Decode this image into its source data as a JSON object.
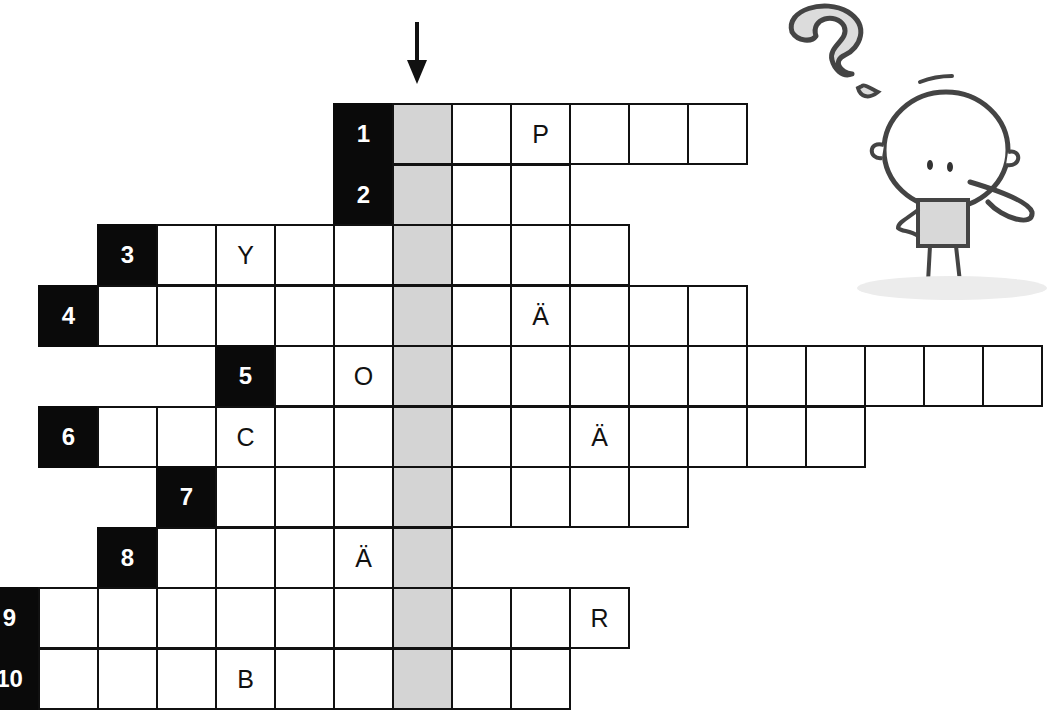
{
  "puzzle": {
    "title_visual": "crossword-with-solution-column",
    "cell_width": 59,
    "cell_height": 61,
    "origin_x": -21,
    "solution_column": 7,
    "colors": {
      "clue_bg": "#0a0a0a",
      "clue_text": "#ffffff",
      "solution_bg": "#d4d4d4",
      "grid_line": "#111111",
      "cell_bg": "#ffffff"
    },
    "arrow": {
      "direction": "down",
      "column": 7
    },
    "rows": [
      {
        "number": "1",
        "y": 103,
        "clue_col": 6,
        "end_col": 12,
        "letters": {
          "9": "P"
        }
      },
      {
        "number": "2",
        "y": 164,
        "clue_col": 6,
        "end_col": 9,
        "letters": {}
      },
      {
        "number": "3",
        "y": 224,
        "clue_col": 2,
        "end_col": 10,
        "letters": {
          "4": "Y"
        }
      },
      {
        "number": "4",
        "y": 285,
        "clue_col": 1,
        "end_col": 12,
        "letters": {
          "9": "Ä"
        }
      },
      {
        "number": "5",
        "y": 345,
        "clue_col": 4,
        "end_col": 17,
        "letters": {
          "6": "O"
        }
      },
      {
        "number": "6",
        "y": 406,
        "clue_col": 1,
        "end_col": 14,
        "letters": {
          "4": "C",
          "10": "Ä"
        }
      },
      {
        "number": "7",
        "y": 466,
        "clue_col": 3,
        "end_col": 11,
        "letters": {}
      },
      {
        "number": "8",
        "y": 527,
        "clue_col": 2,
        "end_col": 7,
        "letters": {
          "6": "Ä"
        }
      },
      {
        "number": "9",
        "y": 587,
        "clue_col": 0,
        "end_col": 10,
        "letters": {
          "10": "R"
        }
      },
      {
        "number": "10",
        "y": 648,
        "clue_col": 0,
        "end_col": 9,
        "letters": {
          "4": "B"
        }
      }
    ]
  },
  "illustration": {
    "mascot": "thinking-stick-figure-icon",
    "question_mark": "question-mark-icon"
  }
}
